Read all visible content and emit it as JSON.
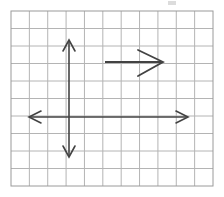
{
  "figure": {
    "type": "geometry-diagram",
    "canvas": {
      "width": 224,
      "height": 197,
      "background": "#ffffff"
    }
  },
  "grid": {
    "name": "square-grid",
    "columns": 11,
    "rows": 10,
    "x_left": 11,
    "y_top": 11,
    "x_right": 213,
    "y_bottom": 186,
    "cell_width": 18.36,
    "cell_height": 17.5,
    "line_color": "#b4b4b4",
    "border_color": "#9a9a9a",
    "line_width": 1
  },
  "axes": {
    "color": "#434343",
    "line_width": 1.6,
    "origin": {
      "x": 69,
      "y": 117
    },
    "vertical": {
      "label": "y-axis",
      "x": 69,
      "y_top": 40,
      "y_bottom": 157,
      "arrow_up": true,
      "arrow_down": true,
      "arrow_length": 11,
      "arrow_half_width": 6
    },
    "horizontal": {
      "label": "x-axis",
      "y": 117,
      "x_left": 29,
      "x_right": 188,
      "arrow_left": true,
      "arrow_right": true,
      "arrow_length": 12,
      "arrow_half_width": 6
    }
  },
  "vector": {
    "label": "horizontal-vector",
    "color": "#434343",
    "line_width": 1.8,
    "tail": {
      "x": 105,
      "y": 62
    },
    "tip": {
      "x": 163,
      "y": 62
    },
    "direction": "right",
    "length_px": 58,
    "length_cells": 3,
    "arrowhead": {
      "style": "open-v",
      "wing_back_x": 138,
      "wing_top_y": 50,
      "wing_bottom_y": 76,
      "line_width": 1.8
    }
  },
  "artifacts": {
    "top_mark": {
      "label": "faint-scan-mark",
      "x": 168,
      "y": 1,
      "width": 8,
      "height": 4,
      "color": "#dcdcdc"
    }
  }
}
